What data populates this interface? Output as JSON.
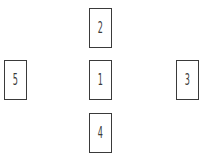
{
  "diagram": {
    "type": "card-spread",
    "cards": [
      {
        "label": "1",
        "position": "center"
      },
      {
        "label": "2",
        "position": "top"
      },
      {
        "label": "3",
        "position": "right"
      },
      {
        "label": "4",
        "position": "bottom"
      },
      {
        "label": "5",
        "position": "left"
      }
    ],
    "colors": {
      "border": "#3a3a3a",
      "text": "#3a3a3a",
      "background": "#ffffff"
    }
  }
}
